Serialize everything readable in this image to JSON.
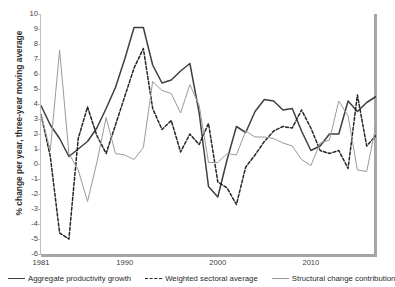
{
  "chart_data": {
    "type": "line",
    "title": "",
    "xlabel": "",
    "ylabel": "% change per year, three-year moving average",
    "xlim": [
      1981,
      2017
    ],
    "ylim": [
      -6,
      10
    ],
    "grid": false,
    "legend_position": "bottom",
    "ytick_labels": [
      "10",
      "9",
      "8",
      "7",
      "6",
      "5",
      "4",
      "3",
      "2",
      "1",
      "0",
      "-1",
      "-2",
      "-3",
      "-4",
      "-5",
      "-6"
    ],
    "ytick_values": [
      10,
      9,
      8,
      7,
      6,
      5,
      4,
      3,
      2,
      1,
      0,
      -1,
      -2,
      -3,
      -4,
      -5,
      -6
    ],
    "xtick_labels": [
      "1981",
      "1990",
      "2000",
      "2010"
    ],
    "xtick_values": [
      1981,
      1990,
      2000,
      2010
    ],
    "x": [
      1981,
      1982,
      1983,
      1984,
      1985,
      1986,
      1987,
      1988,
      1989,
      1990,
      1991,
      1992,
      1993,
      1994,
      1995,
      1996,
      1997,
      1998,
      1999,
      2000,
      2001,
      2002,
      2003,
      2004,
      2005,
      2006,
      2007,
      2008,
      2009,
      2010,
      2011,
      2012,
      2013,
      2014,
      2015,
      2016,
      2017
    ],
    "series": [
      {
        "name": "Aggregate productivity growth",
        "color": "#3f3f3f",
        "style": "solid",
        "values": [
          3.9,
          2.6,
          1.7,
          0.5,
          1.0,
          1.5,
          2.4,
          3.7,
          5.1,
          7.0,
          9.1,
          9.1,
          6.6,
          5.4,
          5.6,
          6.2,
          6.7,
          3.4,
          -1.5,
          -2.2,
          0.3,
          2.5,
          2.1,
          3.5,
          4.3,
          4.2,
          3.6,
          3.7,
          2.2,
          0.9,
          1.2,
          2.0,
          2.0,
          4.2,
          3.5,
          4.1,
          4.5
        ]
      },
      {
        "name": "Weighted sectoral average",
        "color": "#262626",
        "style": "dashed",
        "values": [
          3.3,
          0.5,
          -4.6,
          -5.0,
          1.7,
          3.8,
          1.9,
          0.7,
          2.6,
          4.5,
          6.4,
          7.7,
          3.7,
          2.3,
          2.9,
          0.8,
          2.0,
          1.3,
          2.7,
          -1.2,
          -1.6,
          -2.7,
          -0.2,
          0.6,
          1.5,
          2.2,
          2.5,
          2.4,
          3.6,
          2.4,
          0.9,
          0.7,
          0.9,
          -0.3,
          4.6,
          1.2,
          1.9
        ]
      },
      {
        "name": "Structural change contribution",
        "color": "#9a9a9a",
        "style": "solid",
        "values": [
          3.3,
          0.9,
          7.6,
          0.7,
          -0.4,
          -2.5,
          0.1,
          3.1,
          0.7,
          0.6,
          0.3,
          1.1,
          5.5,
          4.9,
          4.7,
          3.4,
          5.3,
          3.9,
          0.1,
          0.1,
          0.7,
          0.6,
          2.2,
          1.8,
          1.8,
          1.7,
          1.4,
          1.2,
          0.3,
          -0.1,
          1.4,
          1.6,
          4.2,
          3.2,
          -0.4,
          -0.5,
          2.6
        ]
      }
    ]
  },
  "legend": {
    "items": [
      {
        "label": "Aggregate productivity growth",
        "color": "#3f3f3f",
        "style": "solid"
      },
      {
        "label": "Weighted sectoral average",
        "color": "#262626",
        "style": "dashed"
      },
      {
        "label": "Structural change contribution",
        "color": "#9a9a9a",
        "style": "solid"
      }
    ]
  }
}
